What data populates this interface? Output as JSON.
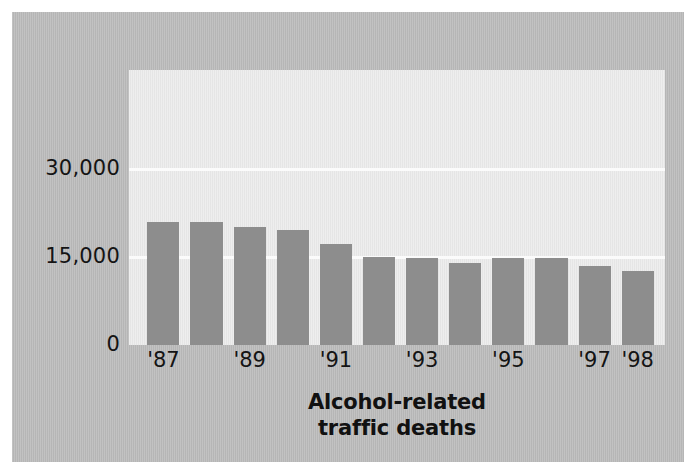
{
  "chart_data": {
    "type": "bar",
    "title": "",
    "caption_line1": "Alcohol-related",
    "caption_line2": "traffic deaths",
    "xlabel": "",
    "ylabel": "",
    "ylim": [
      0,
      47000
    ],
    "grid": true,
    "legend": "none",
    "y_ticks": [
      "0",
      "15,000",
      "30,000"
    ],
    "y_tick_values": [
      0,
      15000,
      30000
    ],
    "categories": [
      "'87",
      "'88",
      "'89",
      "'90",
      "'91",
      "'92",
      "'93",
      "'94",
      "'95",
      "'96",
      "'97",
      "'98"
    ],
    "visible_tick_labels": [
      "'87",
      "'89",
      "'91",
      "'93",
      "'95",
      "'97",
      "'98"
    ],
    "values": [
      21100,
      21100,
      20100,
      19600,
      17300,
      15000,
      14900,
      14000,
      14900,
      14900,
      13500,
      12700
    ],
    "bar_color": "#8d8d8d",
    "plot_background": "#e9e9e9",
    "page_background": "#b9b9b9",
    "gridline_color": "#fbfbfb"
  },
  "axes": {
    "y_label_0": "0",
    "y_label_15000": "15,000",
    "y_label_30000": "30,000"
  }
}
